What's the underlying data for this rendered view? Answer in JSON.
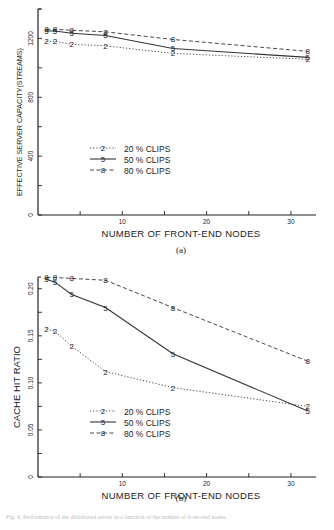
{
  "chart_data": [
    {
      "type": "line",
      "panel_label": "(a)",
      "title": "",
      "xlabel": "NUMBER OF FRONT-END NODES",
      "ylabel": "EFFECTIVE SERVER CAPACITY(STREAMS)",
      "x": [
        1,
        2,
        4,
        8,
        16,
        32
      ],
      "xlim": [
        0,
        32.5
      ],
      "ylim": [
        0,
        1400
      ],
      "xticks": [
        5,
        10,
        15,
        20,
        25,
        30
      ],
      "xtick_labels": [
        "",
        "10",
        "",
        "20",
        "",
        "30"
      ],
      "yticks": [
        0,
        200,
        400,
        600,
        800,
        1000,
        1200,
        1400
      ],
      "ytick_labels": [
        "0",
        "",
        "400",
        "",
        "800",
        "",
        "1200",
        ""
      ],
      "grid": false,
      "legend_position": "center",
      "series": [
        {
          "name": "20 % CLIPS",
          "marker": "2",
          "style": "dotted",
          "values": [
            1180,
            1180,
            1160,
            1150,
            1098,
            1058
          ]
        },
        {
          "name": "50 % CLIPS",
          "marker": "5",
          "style": "solid",
          "values": [
            1250,
            1250,
            1235,
            1220,
            1132,
            1071
          ]
        },
        {
          "name": "80 % CLIPS",
          "marker": "8",
          "style": "dashed",
          "values": [
            1262,
            1262,
            1255,
            1245,
            1193,
            1112
          ]
        }
      ]
    },
    {
      "type": "line",
      "panel_label": "(b)",
      "title": "",
      "xlabel": "NUMBER OF FRONT-END NODES",
      "ylabel": "CACHE HIT RATIO",
      "x": [
        1,
        2,
        4,
        8,
        16,
        32
      ],
      "xlim": [
        0,
        32.5
      ],
      "ylim": [
        0,
        0.2125
      ],
      "xticks": [
        5,
        10,
        15,
        20,
        25,
        30
      ],
      "xtick_labels": [
        "",
        "10",
        "",
        "20",
        "",
        "30"
      ],
      "yticks": [
        0,
        0.025,
        0.05,
        0.075,
        0.1,
        0.125,
        0.15,
        0.175,
        0.2
      ],
      "ytick_labels": [
        "0",
        "",
        "0.05",
        "",
        "0.10",
        "",
        "0.15",
        "",
        "0.20"
      ],
      "grid": false,
      "legend_position": "lower-center",
      "series": [
        {
          "name": "20 % CLIPS",
          "marker": "2",
          "style": "dotted",
          "values": [
            0.157,
            0.155,
            0.139,
            0.112,
            0.095,
            0.075
          ]
        },
        {
          "name": "50 % CLIPS",
          "marker": "5",
          "style": "solid",
          "values": [
            0.21,
            0.207,
            0.194,
            0.18,
            0.131,
            0.07
          ]
        },
        {
          "name": "80 % CLIPS",
          "marker": "8",
          "style": "dashed",
          "values": [
            0.212,
            0.212,
            0.211,
            0.209,
            0.18,
            0.123
          ]
        }
      ]
    }
  ],
  "figure": {
    "caption_a": "(a)",
    "caption_b": "(b)",
    "footer": "Fig. 6. Performance of the distributed server as a function of the number of front-end nodes."
  }
}
